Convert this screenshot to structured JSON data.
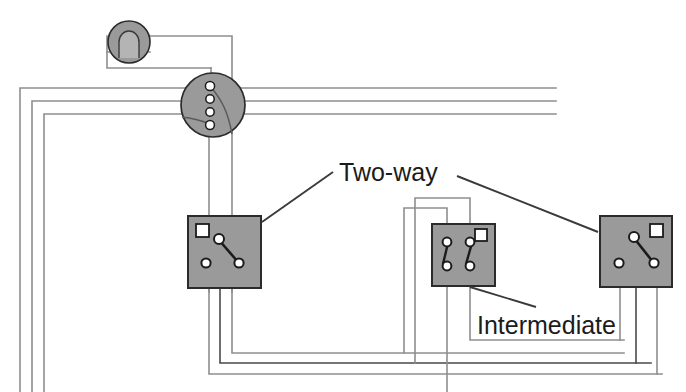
{
  "diagram": {
    "title_labels": [
      {
        "id": "two-way",
        "text": "Two-way"
      },
      {
        "id": "intermediate",
        "text": "Intermediate"
      }
    ],
    "labels": {
      "two_way": "Two-way",
      "intermediate": "Intermediate"
    },
    "colors": {
      "component_fill": "#9a9a9a",
      "component_stroke": "#2b2b2b",
      "terminal_fill": "#ffffff",
      "wire_light": "#9d9d9d",
      "wire_dark": "#4a4a4a",
      "blade_stroke": "#1b1b1b",
      "leader_line": "#3a3a3a",
      "text": "#1b1b1b",
      "background": "#ffffff"
    },
    "components": [
      {
        "id": "lamp",
        "name": "ceiling-lamp",
        "shape": "circle",
        "cx": 129,
        "cy": 42,
        "r": 21,
        "terminals": 0
      },
      {
        "id": "junction-box",
        "name": "junction-box",
        "shape": "circle",
        "cx": 213,
        "cy": 105,
        "r": 32,
        "terminals": 4
      },
      {
        "id": "switch-left",
        "name": "two-way-switch-left",
        "shape": "square",
        "x": 188,
        "y": 216,
        "w": 73,
        "h": 72,
        "terminals": 3,
        "marker": "top-left"
      },
      {
        "id": "switch-middle",
        "name": "intermediate-switch",
        "shape": "square",
        "x": 432,
        "y": 224,
        "w": 63,
        "h": 62,
        "terminals": 4,
        "marker": "top-right"
      },
      {
        "id": "switch-right",
        "name": "two-way-switch-right",
        "shape": "square",
        "x": 600,
        "y": 216,
        "w": 72,
        "h": 71,
        "terminals": 3,
        "marker": "top-right"
      }
    ],
    "cable_runs": [
      {
        "id": "supply-bundle",
        "conductors": 3,
        "route": "left-wall-to-junction"
      },
      {
        "id": "junction-to-left-switch",
        "conductors": 2
      },
      {
        "id": "left-to-intermediate",
        "conductors": 3
      },
      {
        "id": "intermediate-to-right",
        "conductors": 3
      }
    ]
  }
}
